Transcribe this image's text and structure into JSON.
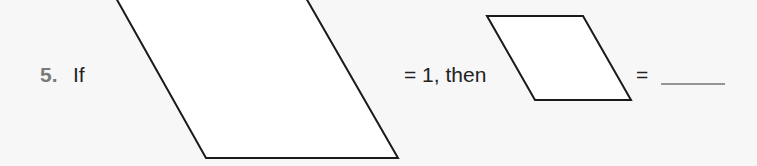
{
  "problem": {
    "number": "5.",
    "word_if": "If",
    "equals_one_then": "= 1, then",
    "equals": "=",
    "answer_blank": ""
  },
  "shapes": {
    "whole": {
      "name": "large parallelogram",
      "value": "1",
      "stroke": "#1a1a1a"
    },
    "part": {
      "name": "small parallelogram",
      "stroke": "#1a1a1a"
    }
  }
}
